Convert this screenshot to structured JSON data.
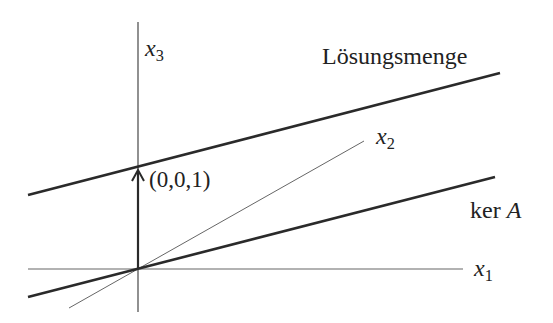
{
  "diagram": {
    "labels": {
      "x1": {
        "var": "x",
        "sub": "1"
      },
      "x2": {
        "var": "x",
        "sub": "2"
      },
      "x3": {
        "var": "x",
        "sub": "3"
      },
      "solution_set": "Lösungsmenge",
      "kernel_prefix": "ker ",
      "kernel_var": "A",
      "vector": "(0,0,1)"
    },
    "colors": {
      "line": "#2a2a2a",
      "axis": "#555555",
      "background": "#ffffff"
    },
    "geometry": {
      "origin": [
        138,
        269
      ],
      "x1_axis": [
        [
          28,
          269
        ],
        [
          463,
          269
        ]
      ],
      "x3_axis": [
        [
          138,
          22
        ],
        [
          138,
          312
        ]
      ],
      "x2_axis": [
        [
          69,
          308
        ],
        [
          364,
          141
        ]
      ],
      "solution_line": [
        [
          28,
          195
        ],
        [
          500,
          73
        ]
      ],
      "kernel_line": [
        [
          28,
          297
        ],
        [
          495,
          177
        ]
      ],
      "vector_arrow": [
        [
          138,
          269
        ],
        [
          138,
          170
        ]
      ]
    }
  }
}
